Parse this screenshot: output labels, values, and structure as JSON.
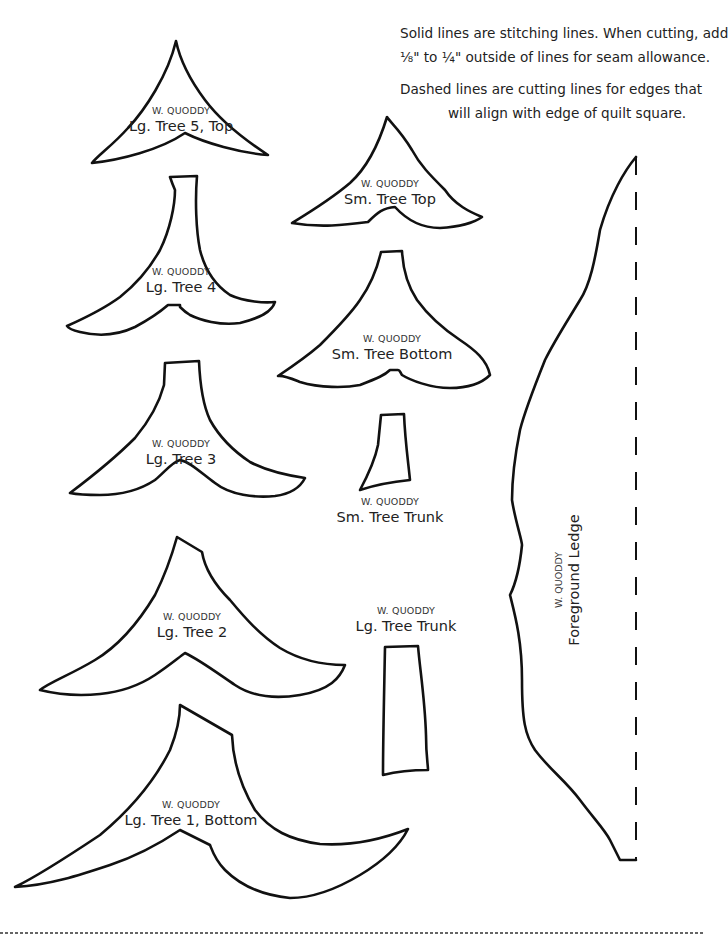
{
  "instructions": {
    "line1": "Solid lines are stitching lines. When cutting, add",
    "line2": "⅛\" to ¼\" outside of lines for seam allowance.",
    "line3": "Dashed lines are cutting lines for edges that",
    "line4": "will align with edge of quilt square."
  },
  "brand": "W. QUODDY",
  "pieces": {
    "lg_tree_5": {
      "brand": "W.  QUODDY",
      "name": "Lg. Tree 5, Top"
    },
    "sm_tree_top": {
      "brand": "W. QUODDY",
      "name": "Sm. Tree Top"
    },
    "lg_tree_4": {
      "brand": "W. QUODDY",
      "name": "Lg. Tree 4"
    },
    "sm_tree_bottom": {
      "brand": "W. QUODDY",
      "name": "Sm. Tree Bottom"
    },
    "lg_tree_3": {
      "brand": "W. QUODDY",
      "name": "Lg. Tree 3"
    },
    "sm_tree_trunk": {
      "brand": "W. QUODDY",
      "name": "Sm. Tree Trunk"
    },
    "foreground_ledge": {
      "brand": "W. QUODDY",
      "name": "Foreground Ledge"
    },
    "lg_tree_2": {
      "brand": "W. QUODDY",
      "name": "Lg. Tree 2"
    },
    "lg_tree_trunk": {
      "brand": "W. QUODDY",
      "name": "Lg. Tree Trunk"
    },
    "lg_tree_1": {
      "brand": "W. QUODDY",
      "name": "Lg. Tree 1, Bottom"
    }
  },
  "colors": {
    "line": "#111111",
    "text": "#222222",
    "background": "#ffffff"
  }
}
